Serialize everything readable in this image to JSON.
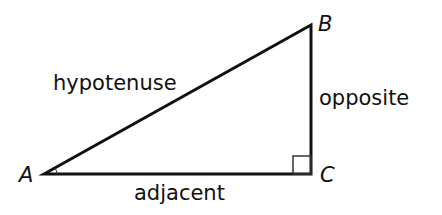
{
  "diagram": {
    "type": "right-triangle",
    "vertices": {
      "A": {
        "label": "A",
        "x": 44,
        "y": 174
      },
      "B": {
        "label": "B",
        "x": 311,
        "y": 25
      },
      "C": {
        "label": "C",
        "x": 311,
        "y": 174
      }
    },
    "sides": {
      "hypotenuse": "hypotenuse",
      "opposite": "opposite",
      "adjacent": "adjacent"
    },
    "right_angle_at": "C",
    "stroke_color": "#111111"
  }
}
